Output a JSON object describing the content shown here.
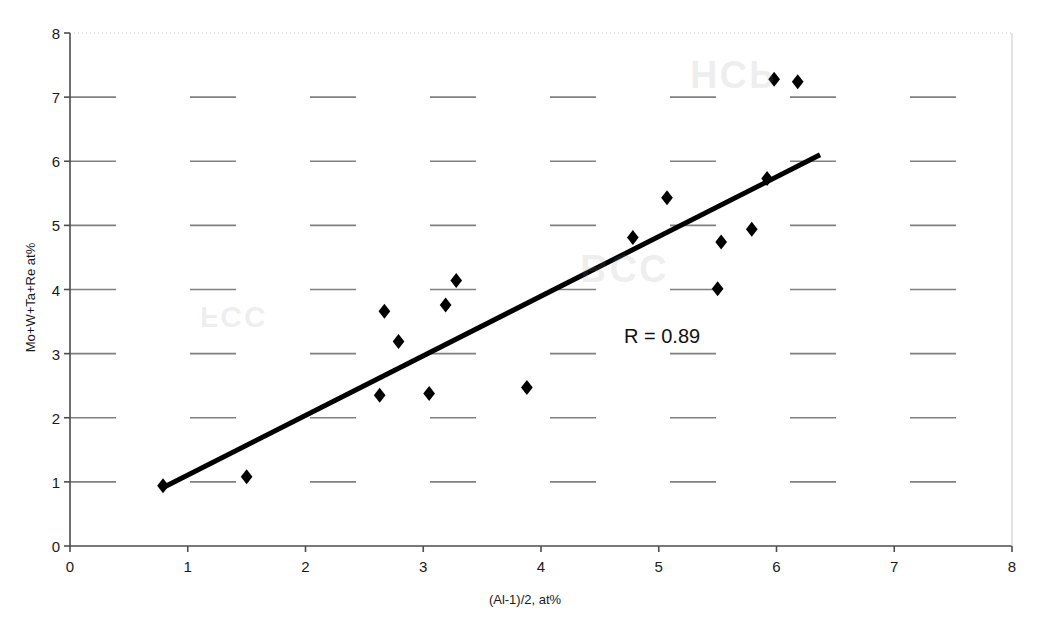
{
  "chart_data": {
    "type": "scatter",
    "title": "",
    "xlabel": "(Al-1)/2, at%",
    "ylabel": "Mo+W+Ta+Re at%",
    "xlim": [
      0,
      8
    ],
    "ylim": [
      0,
      8
    ],
    "xticks": [
      0,
      1,
      2,
      3,
      4,
      5,
      6,
      7,
      8
    ],
    "yticks": [
      0,
      1,
      2,
      3,
      4,
      5,
      6,
      7,
      8
    ],
    "grid": "horizontal-dashed",
    "legend": "none",
    "annotations": [
      {
        "text": "R = 0.89",
        "x": 4.7,
        "y": 3.2
      }
    ],
    "series": [
      {
        "name": "alloy-compositions",
        "marker": "diamond",
        "color": "#000000",
        "points": [
          {
            "x": 0.79,
            "y": 0.94
          },
          {
            "x": 1.5,
            "y": 1.08
          },
          {
            "x": 2.63,
            "y": 2.35
          },
          {
            "x": 2.67,
            "y": 3.66
          },
          {
            "x": 2.79,
            "y": 3.19
          },
          {
            "x": 3.05,
            "y": 2.38
          },
          {
            "x": 3.19,
            "y": 3.76
          },
          {
            "x": 3.28,
            "y": 4.14
          },
          {
            "x": 3.88,
            "y": 2.47
          },
          {
            "x": 4.78,
            "y": 4.81
          },
          {
            "x": 5.07,
            "y": 5.43
          },
          {
            "x": 5.5,
            "y": 4.01
          },
          {
            "x": 5.53,
            "y": 4.74
          },
          {
            "x": 5.79,
            "y": 4.94
          },
          {
            "x": 5.92,
            "y": 5.73
          },
          {
            "x": 5.98,
            "y": 7.28
          },
          {
            "x": 6.18,
            "y": 7.24
          }
        ]
      }
    ],
    "trendline": {
      "name": "linear-fit",
      "color": "#000000",
      "width": 5,
      "x0": 0.8,
      "y0": 0.92,
      "x1": 6.37,
      "y1": 6.1,
      "r": "0.89"
    },
    "watermarks": [
      {
        "text": "HCP",
        "x": 690,
        "y": 52
      },
      {
        "text": "BCC",
        "x": 580,
        "y": 246
      },
      {
        "text": "FCC",
        "x": 200,
        "y": 300
      }
    ]
  }
}
